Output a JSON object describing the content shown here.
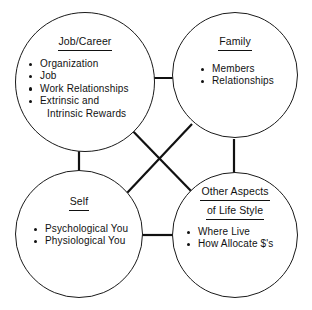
{
  "diagram": {
    "stroke_color": "#111111",
    "background_color": "#ffffff",
    "nodes": [
      {
        "id": "job",
        "title": "Job/Career",
        "title_line2": "",
        "bullets": [
          {
            "text": "Organization",
            "cont": ""
          },
          {
            "text": "Job",
            "cont": ""
          },
          {
            "text": "Work  Relationships",
            "cont": ""
          },
          {
            "text": "Extrinsic  and",
            "cont": "Intrinsic  Rewards"
          }
        ]
      },
      {
        "id": "family",
        "title": "Family",
        "title_line2": "",
        "bullets": [
          {
            "text": "Members",
            "cont": ""
          },
          {
            "text": "Relationships",
            "cont": ""
          }
        ]
      },
      {
        "id": "self",
        "title": "Self",
        "title_line2": "",
        "bullets": [
          {
            "text": "Psychological  You",
            "cont": ""
          },
          {
            "text": "Physiological  You",
            "cont": ""
          }
        ]
      },
      {
        "id": "other",
        "title": "Other  Aspects",
        "title_line2": "of  Life  Style",
        "bullets": [
          {
            "text": "Where  Live",
            "cont": ""
          },
          {
            "text": "How  Allocate  $'s",
            "cont": ""
          }
        ]
      }
    ],
    "connectors": [
      {
        "name": "job-to-family",
        "x1": 140,
        "y1": 78,
        "x2": 173,
        "y2": 78
      },
      {
        "name": "job-to-self",
        "x1": 79,
        "y1": 146,
        "x2": 79,
        "y2": 171
      },
      {
        "name": "family-to-other",
        "x1": 234,
        "y1": 139,
        "x2": 234,
        "y2": 173
      },
      {
        "name": "self-to-other",
        "x1": 142,
        "y1": 235,
        "x2": 173,
        "y2": 235
      },
      {
        "name": "job-to-other",
        "x1": 125,
        "y1": 123,
        "x2": 192,
        "y2": 192
      },
      {
        "name": "family-to-self",
        "x1": 192,
        "y1": 124,
        "x2": 127,
        "y2": 193
      }
    ]
  }
}
